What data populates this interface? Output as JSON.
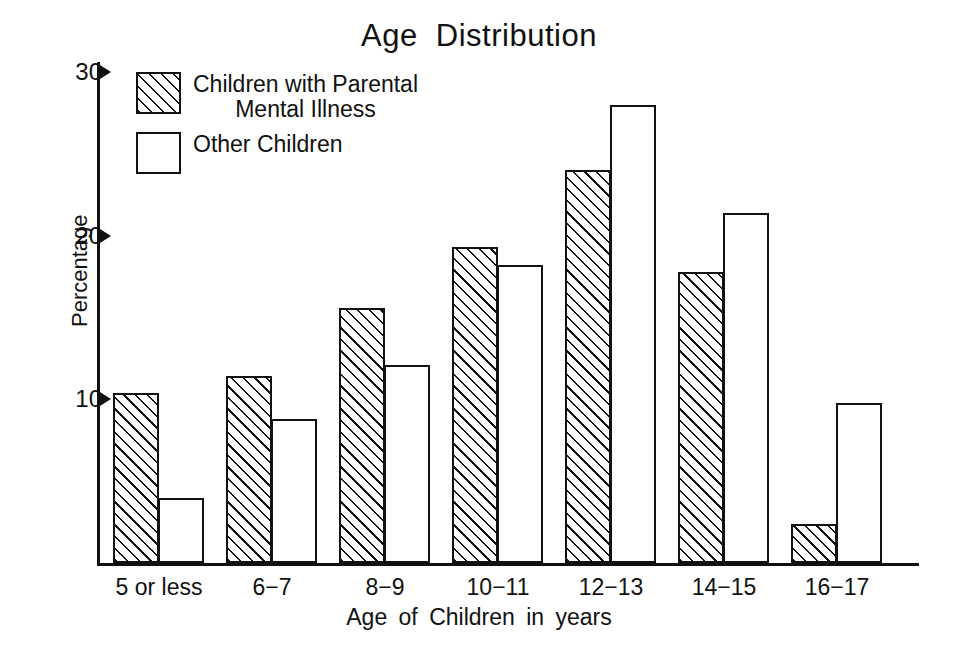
{
  "chart_data": {
    "type": "bar",
    "title": "Age  Distribution",
    "xlabel": "Age of Children in years",
    "ylabel": "Percentage",
    "categories": [
      "5 or less",
      "6−7",
      "8−9",
      "10−11",
      "12−13",
      "14−15",
      "16−17"
    ],
    "series": [
      {
        "name": "Children with Parental Mental Illness",
        "pattern": "hatched",
        "values": [
          10.4,
          11.4,
          15.6,
          19.3,
          24.0,
          17.8,
          2.4
        ]
      },
      {
        "name": "Other Children",
        "pattern": "open",
        "values": [
          4.0,
          8.8,
          12.1,
          18.2,
          28.0,
          21.4,
          9.8
        ]
      }
    ],
    "yticks": [
      10,
      20,
      30
    ],
    "ylim": [
      0,
      30
    ],
    "grid": false,
    "legend_position": "top-left-inside",
    "axis_color": "#111111"
  },
  "legend": {
    "entries": [
      {
        "line1": "Children with Parental",
        "line2": "Mental Illness"
      },
      {
        "line1": "Other Children",
        "line2": ""
      }
    ]
  },
  "axis": {
    "ytick_labels": [
      "10",
      "20",
      "30"
    ]
  }
}
